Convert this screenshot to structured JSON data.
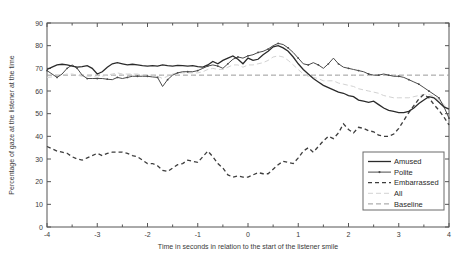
{
  "chart_data": {
    "type": "line",
    "title": "",
    "xlabel": "Time in seconds in relation to the start of the listener smile",
    "ylabel": "Percentage of gaze at the listener at the time",
    "xlim": [
      -4,
      4
    ],
    "ylim": [
      0,
      90
    ],
    "xticks": [
      -4,
      -3,
      -2,
      -1,
      0,
      1,
      2,
      3,
      4
    ],
    "xticklabels": [
      "-4",
      "-3",
      "-2",
      "-1",
      "0",
      "1",
      "2",
      "3",
      "4"
    ],
    "yticks": [
      0,
      10,
      20,
      30,
      40,
      50,
      60,
      70,
      80,
      90
    ],
    "yticklabels": [
      "0",
      "10",
      "20",
      "30",
      "40",
      "50",
      "60",
      "70",
      "80",
      "90"
    ],
    "minor_xticks": [
      -3.5,
      -2.5,
      -1.5,
      -0.5,
      0.5,
      1.5,
      2.5,
      3.5
    ],
    "grid": false,
    "legend_position": "lower right",
    "x": [
      -4.0,
      -3.9,
      -3.8,
      -3.7,
      -3.6,
      -3.5,
      -3.4,
      -3.3,
      -3.2,
      -3.1,
      -3.0,
      -2.9,
      -2.8,
      -2.7,
      -2.6,
      -2.5,
      -2.4,
      -2.3,
      -2.2,
      -2.1,
      -2.0,
      -1.9,
      -1.8,
      -1.7,
      -1.6,
      -1.5,
      -1.4,
      -1.3,
      -1.2,
      -1.1,
      -1.0,
      -0.9,
      -0.8,
      -0.7,
      -0.6,
      -0.5,
      -0.4,
      -0.3,
      -0.2,
      -0.1,
      0.0,
      0.1,
      0.2,
      0.3,
      0.4,
      0.5,
      0.6,
      0.7,
      0.8,
      0.9,
      1.0,
      1.1,
      1.2,
      1.3,
      1.4,
      1.5,
      1.6,
      1.7,
      1.8,
      1.9,
      2.0,
      2.1,
      2.2,
      2.3,
      2.4,
      2.5,
      2.6,
      2.7,
      2.8,
      2.9,
      3.0,
      3.1,
      3.2,
      3.3,
      3.4,
      3.5,
      3.6,
      3.7,
      3.8,
      3.9,
      4.0
    ],
    "series": [
      {
        "name": "Amused",
        "style": "solid",
        "color": "#2b2b2b",
        "values": [
          69.5,
          70.5,
          71.5,
          71.8,
          71.5,
          71.0,
          70.5,
          70.8,
          71.2,
          70.0,
          67.5,
          68.5,
          70.5,
          72.0,
          72.5,
          72.0,
          71.5,
          71.8,
          71.5,
          71.2,
          71.0,
          71.2,
          71.0,
          71.5,
          71.2,
          71.0,
          71.3,
          71.2,
          71.0,
          71.2,
          70.8,
          70.5,
          71.5,
          73.0,
          72.0,
          73.5,
          74.5,
          75.5,
          74.0,
          72.0,
          74.5,
          73.5,
          74.0,
          76.0,
          77.5,
          79.5,
          80.0,
          79.0,
          77.5,
          75.0,
          72.0,
          69.5,
          67.5,
          65.5,
          64.0,
          62.5,
          61.5,
          60.5,
          59.5,
          59.0,
          58.0,
          57.5,
          56.0,
          55.5,
          55.0,
          55.5,
          54.0,
          52.5,
          51.5,
          51.0,
          50.5,
          50.5,
          51.0,
          52.5,
          54.5,
          56.0,
          57.5,
          57.0,
          55.0,
          53.0,
          52.0
        ]
      },
      {
        "name": "Polite",
        "style": "solid-markers",
        "color": "#4a4a4a",
        "values": [
          69.0,
          67.5,
          66.0,
          67.5,
          70.0,
          71.5,
          70.0,
          67.0,
          65.5,
          65.5,
          65.5,
          65.5,
          65.2,
          65.0,
          66.0,
          65.5,
          66.0,
          66.5,
          66.5,
          66.5,
          66.5,
          66.2,
          66.0,
          62.0,
          65.0,
          67.0,
          68.0,
          68.5,
          68.5,
          68.5,
          69.0,
          70.0,
          71.0,
          71.5,
          71.0,
          70.0,
          72.0,
          74.0,
          75.0,
          74.5,
          75.5,
          76.0,
          77.0,
          77.5,
          78.5,
          80.0,
          81.0,
          80.5,
          79.0,
          77.0,
          74.5,
          72.0,
          71.5,
          72.5,
          71.5,
          70.0,
          72.0,
          74.5,
          72.0,
          70.5,
          70.0,
          69.5,
          69.0,
          68.5,
          67.5,
          67.0,
          67.0,
          67.5,
          67.0,
          66.5,
          66.5,
          66.0,
          65.0,
          64.0,
          63.0,
          61.5,
          60.0,
          58.5,
          57.0,
          53.0,
          48.0
        ]
      },
      {
        "name": "Embarrassed",
        "style": "dashed",
        "color": "#3d3d3d",
        "values": [
          35.5,
          34.5,
          33.5,
          33.0,
          32.5,
          31.0,
          30.0,
          29.5,
          30.5,
          31.5,
          32.5,
          31.5,
          32.5,
          33.0,
          33.0,
          33.0,
          32.5,
          31.5,
          31.0,
          29.5,
          28.0,
          28.0,
          27.0,
          25.0,
          24.5,
          26.0,
          27.5,
          28.0,
          29.5,
          29.0,
          28.5,
          31.0,
          33.5,
          31.0,
          28.0,
          26.0,
          23.0,
          22.0,
          22.5,
          22.0,
          22.0,
          23.0,
          24.0,
          23.5,
          23.5,
          25.5,
          27.5,
          29.0,
          28.5,
          28.0,
          30.5,
          33.5,
          35.0,
          33.0,
          35.5,
          38.0,
          40.0,
          39.0,
          41.5,
          45.5,
          43.0,
          41.5,
          44.0,
          43.5,
          42.5,
          42.0,
          40.5,
          40.0,
          40.0,
          41.0,
          43.5,
          47.0,
          50.5,
          53.5,
          56.5,
          58.5,
          57.0,
          54.0,
          51.5,
          48.5,
          45.0
        ]
      },
      {
        "name": "All",
        "style": "light-dashed",
        "color": "#d2d2d2",
        "values": [
          66.0,
          66.2,
          66.5,
          67.0,
          67.5,
          67.5,
          67.0,
          66.5,
          66.5,
          66.5,
          66.0,
          66.5,
          67.0,
          67.5,
          68.0,
          67.5,
          67.5,
          67.5,
          67.5,
          67.0,
          67.0,
          67.0,
          66.5,
          65.5,
          66.5,
          67.5,
          68.0,
          68.0,
          68.0,
          68.0,
          68.0,
          68.5,
          69.5,
          70.0,
          69.5,
          69.5,
          70.5,
          71.5,
          71.5,
          70.5,
          71.5,
          71.5,
          72.0,
          72.5,
          73.5,
          75.0,
          75.5,
          75.0,
          73.5,
          71.5,
          69.5,
          67.5,
          66.5,
          66.0,
          65.5,
          64.5,
          64.5,
          64.5,
          63.5,
          63.0,
          62.5,
          62.0,
          61.0,
          60.5,
          60.0,
          59.5,
          59.0,
          58.0,
          57.5,
          57.0,
          57.0,
          57.0,
          57.0,
          57.5,
          58.0,
          58.5,
          58.5,
          57.5,
          56.0,
          54.0,
          52.0
        ]
      },
      {
        "name": "Baseline",
        "style": "dashed-gray",
        "color": "#9a9a9a",
        "constant": 67.0,
        "values": [
          67.0,
          67.0,
          67.0,
          67.0,
          67.0,
          67.0,
          67.0,
          67.0,
          67.0,
          67.0,
          67.0,
          67.0,
          67.0,
          67.0,
          67.0,
          67.0,
          67.0,
          67.0,
          67.0,
          67.0,
          67.0,
          67.0,
          67.0,
          67.0,
          67.0,
          67.0,
          67.0,
          67.0,
          67.0,
          67.0,
          67.0,
          67.0,
          67.0,
          67.0,
          67.0,
          67.0,
          67.0,
          67.0,
          67.0,
          67.0,
          67.0,
          67.0,
          67.0,
          67.0,
          67.0,
          67.0,
          67.0,
          67.0,
          67.0,
          67.0,
          67.0,
          67.0,
          67.0,
          67.0,
          67.0,
          67.0,
          67.0,
          67.0,
          67.0,
          67.0,
          67.0,
          67.0,
          67.0,
          67.0,
          67.0,
          67.0,
          67.0,
          67.0,
          67.0,
          67.0,
          67.0,
          67.0,
          67.0,
          67.0,
          67.0,
          67.0,
          67.0,
          67.0,
          67.0,
          67.0,
          67.0
        ]
      }
    ],
    "legend": [
      {
        "label": "Amused",
        "style": "solid"
      },
      {
        "label": "Polite",
        "style": "solid-markers"
      },
      {
        "label": "Embarrassed",
        "style": "dashed"
      },
      {
        "label": "All",
        "style": "light-dashed"
      },
      {
        "label": "Baseline",
        "style": "dashed-gray"
      }
    ]
  }
}
